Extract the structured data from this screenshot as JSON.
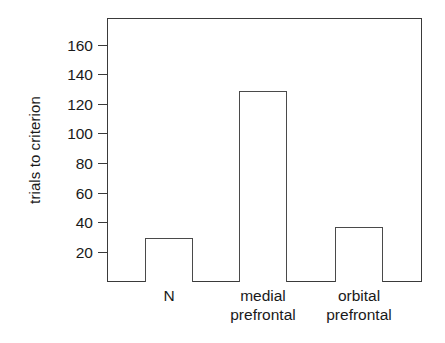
{
  "chart_data": {
    "type": "bar",
    "title": "",
    "subtitle": "",
    "xlabel": "",
    "ylabel": "trials to criterion",
    "categories": [
      "N",
      "medial prefrontal",
      "orbital prefrontal"
    ],
    "category_lines": [
      [
        "N",
        ""
      ],
      [
        "medial",
        "prefrontal"
      ],
      [
        "orbital",
        "prefrontal"
      ]
    ],
    "values": [
      30,
      129,
      37
    ],
    "ylim": [
      0,
      178
    ],
    "yticks": [
      20,
      40,
      60,
      80,
      100,
      120,
      140,
      160
    ],
    "ytick_labels": [
      "20",
      "40",
      "60",
      "80",
      "100",
      "120",
      "140",
      "160"
    ],
    "grid": false,
    "legend": false,
    "legend_position": "none",
    "bar_fill_color": "#ffffff",
    "bar_edge_color": "#4a4a4a",
    "axis_color": "#3a3a3a",
    "background_color": "#ffffff",
    "text_color": "#1a1a1a"
  },
  "axes": {
    "y_title": "trials to criterion"
  }
}
